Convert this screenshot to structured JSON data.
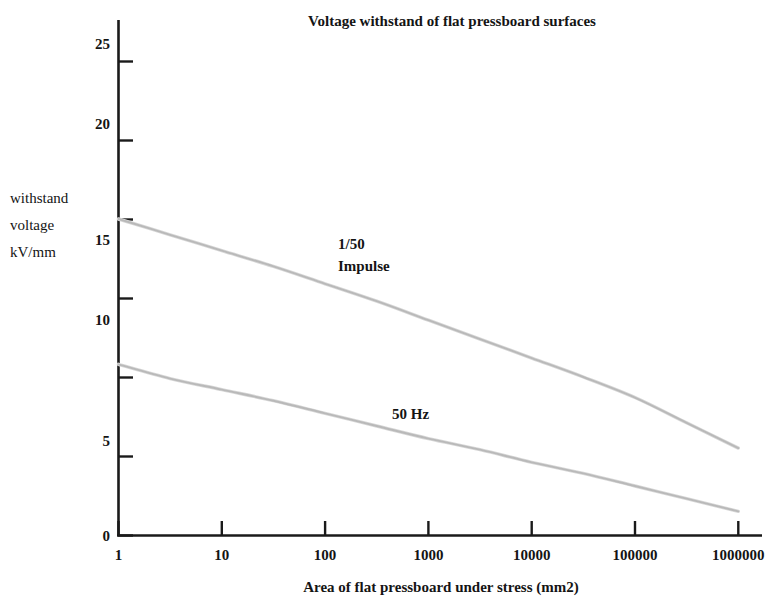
{
  "chart_data": {
    "type": "line",
    "title": "Voltage withstand of flat pressboard surfaces",
    "xlabel": "Area of flat pressboard under stress (mm2)",
    "ylabel": "withstand voltage kV/mm",
    "ylabel_lines": [
      "withstand",
      "voltage",
      "kV/mm"
    ],
    "xscale": "log",
    "yscale": "linear",
    "xlim": [
      1,
      1000000
    ],
    "ylim": [
      0,
      25
    ],
    "grid": false,
    "legend": "inline-annotations",
    "xticks": [
      1,
      10,
      100,
      1000,
      10000,
      100000,
      1000000
    ],
    "xtick_labels": [
      "1",
      "10",
      "100",
      "1000",
      "10000",
      "100000",
      "1000000"
    ],
    "yticks": [
      0,
      5,
      10,
      15,
      20,
      25
    ],
    "ytick_labels": [
      "0",
      "5",
      "10",
      "15",
      "20",
      "25"
    ],
    "x": [
      1,
      3.16,
      10,
      31.6,
      100,
      316,
      1000,
      3160,
      10000,
      31600,
      100000,
      316000,
      1000000
    ],
    "series": [
      {
        "name": "1/50 Impulse",
        "label_lines": [
          "1/50",
          "Impulse"
        ],
        "color": "#b9b9b9",
        "label_x": 1000,
        "label_y": 14.6,
        "values": [
          20.0,
          19.0,
          18.0,
          17.0,
          15.9,
          14.8,
          13.6,
          12.4,
          11.2,
          10.0,
          8.7,
          7.1,
          5.5
        ]
      },
      {
        "name": "50 Hz",
        "label_lines": [
          "50 Hz"
        ],
        "color": "#b9b9b9",
        "label_x": 2200,
        "label_y": 6.3,
        "values": [
          10.8,
          9.9,
          9.2,
          8.5,
          7.7,
          6.9,
          6.1,
          5.4,
          4.6,
          3.9,
          3.1,
          2.3,
          1.5
        ]
      }
    ],
    "annotations": [
      {
        "text": "1/50",
        "x_px": 338,
        "y_px": 249
      },
      {
        "text": "Impulse",
        "x_px": 338,
        "y_px": 270
      },
      {
        "text": "50 Hz",
        "x_px": 392,
        "y_px": 419
      }
    ]
  }
}
